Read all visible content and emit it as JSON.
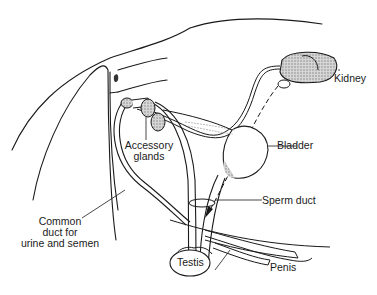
{
  "diagram": {
    "type": "anatomical",
    "colors": {
      "line": "#1a1a1a",
      "shade": "#9a9a9a",
      "background": "#ffffff"
    },
    "labels": {
      "kidney": "Kidney",
      "bladder": "Bladder",
      "accessory_glands_1": "Accessory",
      "accessory_glands_2": "glands",
      "sperm_duct": "Sperm duct",
      "common_duct_1": "Common",
      "common_duct_2": "duct for",
      "common_duct_3": "urine and semen",
      "testis": "Testis",
      "penis": "Penis"
    }
  }
}
